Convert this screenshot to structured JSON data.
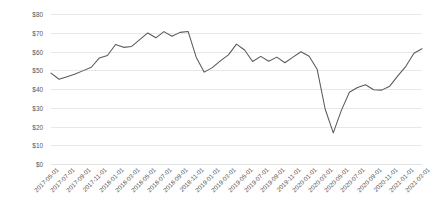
{
  "chart_data": {
    "type": "line",
    "title": "",
    "subtitle": "",
    "xlabel": "",
    "ylabel": "",
    "ylim": [
      0,
      80
    ],
    "y_tick_values": [
      0,
      10,
      20,
      30,
      40,
      50,
      60,
      70,
      80
    ],
    "y_tick_labels": [
      "$0",
      "$10",
      "$20",
      "$30",
      "$40",
      "$50",
      "$60",
      "$70",
      "$80"
    ],
    "grid": true,
    "legend": null,
    "legend_position": "none",
    "x_tick_labels": [
      "2017-05-01",
      "2017-07-01",
      "2017-09-01",
      "2017-11-01",
      "2018-01-01",
      "2018-03-01",
      "2018-05-01",
      "2018-07-01",
      "2018-09-01",
      "2018-11-01",
      "2019-01-01",
      "2019-03-01",
      "2019-05-01",
      "2019-07-01",
      "2019-09-01",
      "2019-11-01",
      "2020-01-01",
      "2020-03-01",
      "2020-05-01",
      "2020-07-01",
      "2020-09-01",
      "2020-11-01",
      "2021-01-01",
      "2021-03-01"
    ],
    "x": [
      "2017-05-01",
      "2017-06-01",
      "2017-07-01",
      "2017-08-01",
      "2017-09-01",
      "2017-10-01",
      "2017-11-01",
      "2017-12-01",
      "2018-01-01",
      "2018-02-01",
      "2018-03-01",
      "2018-04-01",
      "2018-05-01",
      "2018-06-01",
      "2018-07-01",
      "2018-08-01",
      "2018-09-01",
      "2018-10-01",
      "2018-11-01",
      "2018-12-01",
      "2019-01-01",
      "2019-02-01",
      "2019-03-01",
      "2019-04-01",
      "2019-05-01",
      "2019-06-01",
      "2019-07-01",
      "2019-08-01",
      "2019-09-01",
      "2019-10-01",
      "2019-11-01",
      "2019-12-01",
      "2020-01-01",
      "2020-02-01",
      "2020-03-01",
      "2020-04-01",
      "2020-05-01",
      "2020-06-01",
      "2020-07-01",
      "2020-08-01",
      "2020-09-01",
      "2020-10-01",
      "2020-11-01",
      "2020-12-01",
      "2021-01-01",
      "2021-02-01",
      "2021-03-01"
    ],
    "values": [
      48.5,
      45.2,
      46.6,
      48.0,
      49.8,
      51.6,
      56.6,
      57.9,
      63.7,
      62.2,
      62.7,
      66.3,
      69.9,
      67.3,
      70.6,
      68.1,
      70.2,
      70.7,
      57.0,
      49.0,
      51.4,
      55.0,
      58.2,
      63.9,
      60.8,
      54.7,
      57.4,
      54.8,
      57.0,
      54.0,
      57.0,
      59.9,
      57.5,
      50.5,
      29.2,
      16.6,
      28.6,
      38.3,
      40.8,
      42.3,
      39.6,
      39.4,
      41.5,
      47.0,
      52.1,
      59.1,
      61.5
    ],
    "series_color": "#595959",
    "gridline_color": "#e8e8e8",
    "background_color": "#ffffff",
    "first_value": 48.5,
    "last_value": 61.5,
    "min_value": 16.6,
    "min_point_x": "2020-04-01",
    "max_value": 70.7,
    "max_point_x": "2018-10-01"
  }
}
